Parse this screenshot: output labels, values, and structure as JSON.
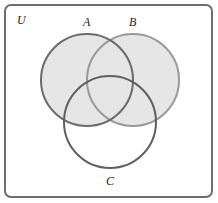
{
  "diagram": {
    "type": "venn",
    "universe_label": "U",
    "sets": [
      {
        "id": "A",
        "label": "A",
        "cx": 87,
        "cy": 80,
        "r": 46,
        "stroke": "#6b6b6b"
      },
      {
        "id": "B",
        "label": "B",
        "cx": 133,
        "cy": 80,
        "r": 46,
        "stroke": "#9a9a9a"
      },
      {
        "id": "C",
        "label": "C",
        "cx": 110,
        "cy": 122,
        "r": 46,
        "stroke": "#5f5f5f"
      }
    ],
    "shaded_region": "A ∪ B",
    "colors": {
      "shade": "#e6e6e6",
      "frame": "#6e6e6e",
      "background": "#ffffff"
    }
  }
}
